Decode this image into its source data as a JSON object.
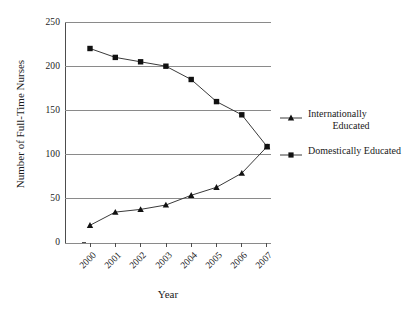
{
  "chart_data": {
    "type": "line",
    "title": "",
    "xlabel": "Year",
    "ylabel": "Number of Full-Time Nurses",
    "categories": [
      "2000",
      "2001",
      "2002",
      "2003",
      "2004",
      "2005",
      "2006",
      "2007"
    ],
    "ylim": [
      0,
      250
    ],
    "yticks": [
      "0",
      "50",
      "100",
      "150",
      "200",
      "250"
    ],
    "grid": "horizontal",
    "legend_position": "right",
    "series": [
      {
        "name": "Internationally Educated",
        "name_line1": "Internationally",
        "name_line2": "Educated",
        "marker": "triangle",
        "values": [
          20,
          35,
          38,
          43,
          54,
          63,
          79,
          109
        ]
      },
      {
        "name": "Domestically Educated",
        "name_line1": "Domestically Educated",
        "name_line2": "",
        "marker": "square",
        "values": [
          220,
          210,
          205,
          200,
          185,
          160,
          145,
          109
        ]
      }
    ]
  },
  "colors": {
    "line": "#3a3a3a",
    "marker": "#111111",
    "grid": "#8a8a8a",
    "axis": "#4d4d4d",
    "text": "#1a1a1a",
    "background": "#ffffff"
  }
}
